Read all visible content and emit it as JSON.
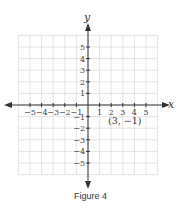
{
  "figure": {
    "caption": "Figure 4",
    "x_axis_label": "x",
    "y_axis_label": "y",
    "point_label": "(3, −1)"
  },
  "chart_data": {
    "type": "scatter",
    "title": "Figure 4",
    "xlabel": "x",
    "ylabel": "y",
    "xlim": [
      -6,
      6
    ],
    "ylim": [
      -6,
      6
    ],
    "grid": true,
    "x_ticks": [
      "-5",
      "-4",
      "-3",
      "-2",
      "-1",
      "1",
      "2",
      "3",
      "4",
      "5"
    ],
    "y_ticks": [
      "5",
      "4",
      "3",
      "2",
      "1",
      "-1",
      "-2",
      "-3",
      "-4",
      "-5"
    ],
    "points": [
      {
        "x": 3,
        "y": -1,
        "label": "(3, −1)"
      }
    ],
    "annotations": [
      "(3, −1)"
    ]
  },
  "colors": {
    "grid": "#d6d6d6",
    "axis": "#333333",
    "text": "#333333"
  }
}
